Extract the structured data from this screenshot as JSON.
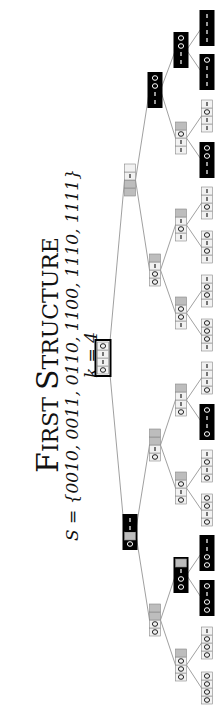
{
  "title": {
    "main_first": "F",
    "main_first_rest": "IRST",
    "main_second": "S",
    "main_second_rest": "TRUCTURE",
    "set_line": "S = {0010, 0011, 0110, 1100, 1110, 1111}",
    "k_line": "k = 4"
  },
  "colors": {
    "dark_node": "#000000",
    "light_node": "#f2f2f2",
    "gray_fill": "#bdbdbd",
    "cell_border": "#888888",
    "edge": "#888888"
  },
  "tree": {
    "root": {
      "id": "r",
      "cells": [
        "0",
        "1",
        "1",
        "0"
      ],
      "style": "outlined",
      "u": 352,
      "v": 103
    },
    "level1": [
      {
        "id": "0",
        "cells": [
          "0",
          "g",
          "1",
          "1"
        ],
        "style": "dark",
        "u": 178,
        "v": 130
      },
      {
        "id": "1",
        "cells": [
          "g",
          "g",
          "1",
          ""
        ],
        "style": "light",
        "u": 530,
        "v": 130
      }
    ],
    "level2": [
      {
        "id": "00",
        "cells": [
          "0",
          "0",
          "g",
          "g"
        ],
        "style": "light",
        "u": 90,
        "v": 155
      },
      {
        "id": "01",
        "cells": [
          "0",
          "1",
          "g",
          "g"
        ],
        "style": "light",
        "u": 265,
        "v": 155
      },
      {
        "id": "10",
        "cells": [
          "0",
          "0",
          "1",
          "g"
        ],
        "style": "light",
        "u": 440,
        "v": 155
      },
      {
        "id": "11",
        "cells": [
          "1",
          "1",
          "0",
          "0"
        ],
        "style": "dark",
        "u": 620,
        "v": 155
      }
    ],
    "level3": [
      {
        "id": "000",
        "cells": [
          "0",
          "0",
          "0",
          "g"
        ],
        "style": "light",
        "u": 45,
        "v": 181
      },
      {
        "id": "001",
        "cells": [
          "0",
          "0",
          "1",
          "g"
        ],
        "style": "dark",
        "u": 135,
        "v": 181
      },
      {
        "id": "010",
        "cells": [
          "0",
          "1",
          "0",
          "g"
        ],
        "style": "light",
        "u": 222,
        "v": 181
      },
      {
        "id": "011",
        "cells": [
          "0",
          "1",
          "1",
          "g"
        ],
        "style": "light",
        "u": 310,
        "v": 181
      },
      {
        "id": "100",
        "cells": [
          "1",
          "0",
          "0",
          "g"
        ],
        "style": "light",
        "u": 397,
        "v": 181
      },
      {
        "id": "101",
        "cells": [
          "1",
          "0",
          "1",
          "g"
        ],
        "style": "light",
        "u": 485,
        "v": 181
      },
      {
        "id": "110",
        "cells": [
          "1",
          "1",
          "0",
          "g"
        ],
        "style": "light",
        "u": 572,
        "v": 181
      },
      {
        "id": "111",
        "cells": [
          "1",
          "1",
          "0",
          "0"
        ],
        "style": "dark",
        "u": 660,
        "v": 181
      }
    ],
    "leaves": [
      {
        "id": "0000",
        "cells": [
          "0",
          "0",
          "0",
          "0"
        ],
        "style": "light",
        "u": 22
      },
      {
        "id": "0001",
        "cells": [
          "0",
          "0",
          "0",
          "1"
        ],
        "style": "light",
        "u": 67
      },
      {
        "id": "0010",
        "cells": [
          "0",
          "0",
          "1",
          "0"
        ],
        "style": "dark",
        "u": 112
      },
      {
        "id": "0011",
        "cells": [
          "0",
          "0",
          "1",
          "1"
        ],
        "style": "dark",
        "u": 157
      },
      {
        "id": "0100",
        "cells": [
          "0",
          "1",
          "0",
          "0"
        ],
        "style": "light",
        "u": 200
      },
      {
        "id": "0101",
        "cells": [
          "0",
          "1",
          "0",
          "1"
        ],
        "style": "light",
        "u": 244
      },
      {
        "id": "0110",
        "cells": [
          "0",
          "1",
          "1",
          "0"
        ],
        "style": "dark",
        "u": 288
      },
      {
        "id": "0111",
        "cells": [
          "0",
          "1",
          "1",
          "1"
        ],
        "style": "light",
        "u": 332
      },
      {
        "id": "1000",
        "cells": [
          "1",
          "0",
          "0",
          "0"
        ],
        "style": "light",
        "u": 375
      },
      {
        "id": "1001",
        "cells": [
          "1",
          "0",
          "0",
          "1"
        ],
        "style": "light",
        "u": 419
      },
      {
        "id": "1010",
        "cells": [
          "1",
          "0",
          "1",
          "0"
        ],
        "style": "light",
        "u": 463
      },
      {
        "id": "1011",
        "cells": [
          "1",
          "0",
          "1",
          "1"
        ],
        "style": "light",
        "u": 507
      },
      {
        "id": "1100",
        "cells": [
          "1",
          "1",
          "0",
          "0"
        ],
        "style": "dark",
        "u": 550
      },
      {
        "id": "1101",
        "cells": [
          "1",
          "1",
          "0",
          "1"
        ],
        "style": "light",
        "u": 594
      },
      {
        "id": "1110",
        "cells": [
          "1",
          "1",
          "1",
          "0"
        ],
        "style": "dark",
        "u": 638
      },
      {
        "id": "1111",
        "cells": [
          "1",
          "1",
          "1",
          "1"
        ],
        "style": "dark",
        "u": 682
      }
    ],
    "leaf_v": 207
  }
}
